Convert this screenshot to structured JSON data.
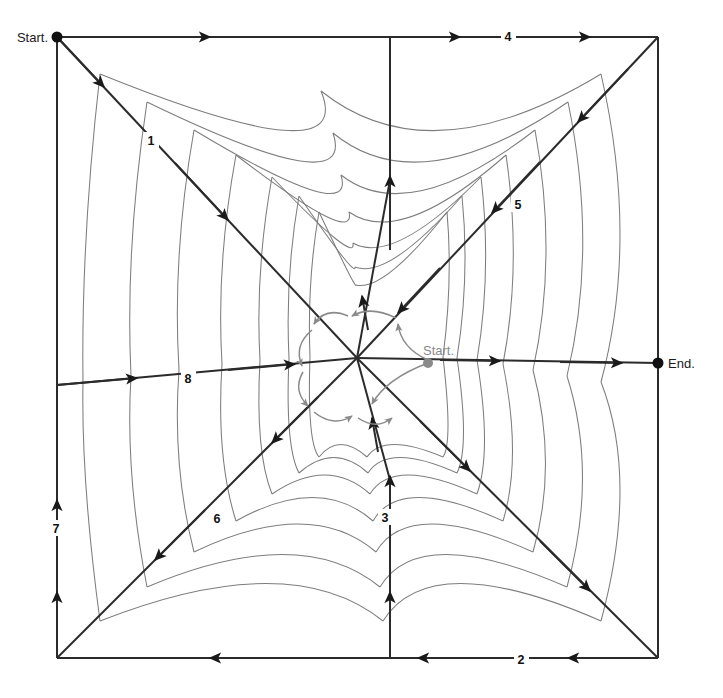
{
  "diagram": {
    "type": "spider-web-path",
    "canvas": {
      "width": 723,
      "height": 698
    },
    "square": {
      "left": 57,
      "top": 37,
      "right": 658,
      "bottom": 658
    },
    "center": {
      "x": 357,
      "y": 358
    },
    "colors": {
      "frame": "#2b2b2b",
      "thread": "#7d7d7d",
      "spiral": "#8a8a8a",
      "label": "#1a1a1a",
      "label_secondary": "#8a8a8a",
      "background": "#ffffff"
    },
    "markers": [
      {
        "id": "start-outer",
        "label": "Start.",
        "x": 57,
        "y": 37,
        "color": "#111111",
        "text_anchor": "end",
        "text_x": 48,
        "text_y": 42
      },
      {
        "id": "end-outer",
        "label": "End.",
        "x": 658,
        "y": 363,
        "color": "#111111",
        "text_anchor": "start",
        "text_x": 668,
        "text_y": 368
      },
      {
        "id": "start-inner",
        "label": "Start.",
        "x": 428,
        "y": 363,
        "color": "#8a8a8a",
        "text_anchor": "start",
        "text_x": 423,
        "text_y": 355
      }
    ],
    "step_labels": [
      {
        "n": "1",
        "x": 151,
        "y": 143,
        "desc": "upper-left diagonal spoke"
      },
      {
        "n": "2",
        "x": 521,
        "y": 662,
        "desc": "bottom edge leftward"
      },
      {
        "n": "3",
        "x": 385,
        "y": 520,
        "desc": "lower vertical spoke upward"
      },
      {
        "n": "4",
        "x": 508,
        "y": 38,
        "desc": "top edge rightward"
      },
      {
        "n": "5",
        "x": 518,
        "y": 207,
        "desc": "upper-right diagonal spoke"
      },
      {
        "n": "6",
        "x": 217,
        "y": 521,
        "desc": "lower-left diagonal spoke"
      },
      {
        "n": "7",
        "x": 56,
        "y": 531,
        "desc": "left edge upward"
      },
      {
        "n": "8",
        "x": 188,
        "y": 381,
        "desc": "horizontal left-to-right spoke"
      }
    ],
    "spokes": [
      {
        "id": "spoke-nw",
        "label": "1",
        "from": "center",
        "to_x": 57,
        "to_y": 37,
        "arrow_dir": "outward-to-inward"
      },
      {
        "id": "spoke-n",
        "label": "",
        "from": "center",
        "to_x": 390,
        "to_y": 37,
        "arrow_dir": "inward"
      },
      {
        "id": "spoke-ne",
        "label": "5",
        "from": "center",
        "to_x": 658,
        "to_y": 37,
        "arrow_dir": "inward"
      },
      {
        "id": "spoke-e",
        "label": "8",
        "from": "center",
        "to_x": 658,
        "to_y": 363,
        "arrow_dir": "outward"
      },
      {
        "id": "spoke-se",
        "label": "",
        "from": "center",
        "to_x": 658,
        "to_y": 658,
        "arrow_dir": "outward"
      },
      {
        "id": "spoke-s",
        "label": "3",
        "from": "center",
        "to_x": 390,
        "to_y": 658,
        "arrow_dir": "inward"
      },
      {
        "id": "spoke-sw",
        "label": "6",
        "from": "center",
        "to_x": 57,
        "to_y": 658,
        "arrow_dir": "outward"
      },
      {
        "id": "spoke-w",
        "label": "",
        "from": "center",
        "to_x": 57,
        "to_y": 385,
        "arrow_dir": "inward"
      }
    ],
    "edges": [
      {
        "id": "edge-top",
        "label": "4",
        "direction": "rightward",
        "arrow_count": 3
      },
      {
        "id": "edge-right",
        "label": "",
        "direction": "none",
        "arrow_count": 0
      },
      {
        "id": "edge-bottom",
        "label": "2",
        "direction": "leftward",
        "arrow_count": 3
      },
      {
        "id": "edge-left",
        "label": "7",
        "direction": "upward",
        "arrow_count": 2
      }
    ],
    "thread_rings": 6,
    "spiral_turns": 1.5
  }
}
